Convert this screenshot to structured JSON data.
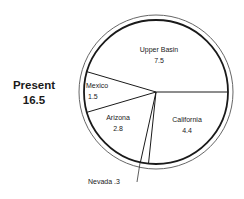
{
  "chart_data": {
    "type": "pie",
    "title": "Present",
    "total": "16.5",
    "categories": [
      "California",
      "Nevada",
      "Arizona",
      "Mexico",
      "Upper Basin"
    ],
    "values": [
      4.4,
      0.3,
      2.8,
      1.5,
      7.5
    ],
    "labels": {
      "upper_basin": {
        "name": "Upper Basin",
        "value": "7.5"
      },
      "mexico": {
        "name": "Mexico",
        "value": "1.5"
      },
      "arizona": {
        "name": "Arizona",
        "value": "2.8"
      },
      "california": {
        "name": "California",
        "value": "4.4"
      },
      "nevada": {
        "name": "Nevada",
        "value": ".3"
      }
    },
    "start_angle_deg": 0,
    "direction": "clockwise",
    "fill_color": "#ffffff",
    "stroke_color": "#1a1a1a"
  }
}
